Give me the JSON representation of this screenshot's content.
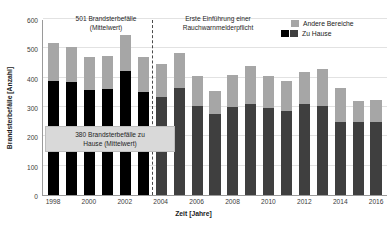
{
  "chart_data": {
    "type": "bar",
    "stacked": true,
    "title": "",
    "xlabel": "Zeit [Jahre]",
    "ylabel": "Brandsterbefälle [Anzahl]",
    "ylim": [
      0,
      600
    ],
    "yticks": [
      0,
      100,
      200,
      300,
      400,
      500,
      600
    ],
    "grid": true,
    "legend_position": "top-right",
    "categories": [
      "1998",
      "1999",
      "2000",
      "2001",
      "2002",
      "2003",
      "2004",
      "2005",
      "2006",
      "2007",
      "2008",
      "2009",
      "2010",
      "2011",
      "2012",
      "2013",
      "2014",
      "2015",
      "2016"
    ],
    "xtick_labels": [
      "1998",
      "",
      "2000",
      "",
      "2002",
      "",
      "2004",
      "",
      "2006",
      "",
      "2008",
      "",
      "2010",
      "",
      "2012",
      "",
      "2014",
      "",
      "2016"
    ],
    "series": [
      {
        "name": "Zu Hause",
        "values": [
          390,
          385,
          358,
          360,
          422,
          350,
          335,
          365,
          305,
          275,
          300,
          310,
          298,
          285,
          310,
          305,
          250,
          248,
          248
        ]
      },
      {
        "name": "Andere Bereiche",
        "values": [
          128,
          118,
          113,
          113,
          125,
          122,
          110,
          118,
          100,
          78,
          110,
          130,
          108,
          105,
          110,
          125,
          115,
          72,
          75
        ]
      }
    ],
    "totals": [
      518,
      503,
      471,
      473,
      547,
      472,
      445,
      483,
      405,
      353,
      410,
      440,
      406,
      390,
      420,
      430,
      365,
      320,
      323
    ],
    "pre_law_years": [
      "1998",
      "1999",
      "2000",
      "2001",
      "2002",
      "2003"
    ],
    "annotations": [
      {
        "id": "mean-total",
        "text": "501 Brandsterbefälle\n(Mittelwert)"
      },
      {
        "id": "law-intro",
        "text": "Erste Einführung einer\nRauchwarnmelderpflicht"
      },
      {
        "id": "mean-home",
        "text": "380 Brandsterbefälle zu\nHause (Mittelwert)"
      }
    ],
    "divider": {
      "after_category": "2003",
      "style": "dashed"
    },
    "colors": {
      "other_areas": "#a6a6a6",
      "home_pre_law": "#000000",
      "home_post_law": "#3f3f3f",
      "gridline": "#e2e2e2",
      "axis": "#9a9a9a",
      "annotation_box": "#d9d9d9"
    }
  },
  "legend": {
    "items": [
      {
        "label": "Andere Bereiche",
        "swatches": [
          "other"
        ]
      },
      {
        "label": "Zu Hause",
        "swatches": [
          "black",
          "dark"
        ]
      }
    ]
  }
}
